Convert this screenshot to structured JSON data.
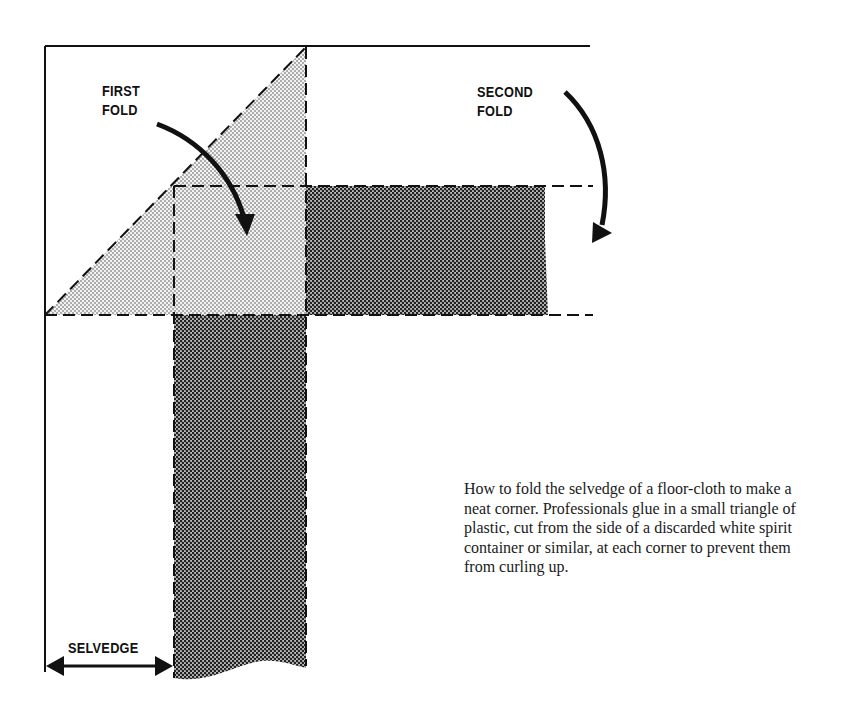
{
  "diagram": {
    "labels": {
      "first_fold": "FIRST\nFOLD",
      "second_fold": "SECOND\nFOLD",
      "selvedge": "SELVEDGE"
    },
    "caption": "How to fold the selvedge of a floor-cloth to make a neat corner. Professionals glue in a small triangle of plastic, cut from the side of a discarded white spirit container or similar, at each corner to prevent them from curling up.",
    "colors": {
      "line": "#111111",
      "light_stipple": "#d9d9d9",
      "dark_stipple": "#8a8a8a",
      "background": "#ffffff"
    }
  }
}
